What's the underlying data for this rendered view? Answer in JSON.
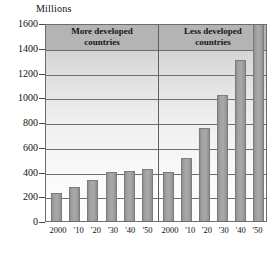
{
  "chart_data": {
    "type": "bar",
    "title": "",
    "units_label": "Millions",
    "xlabel": "",
    "ylabel": "Millions",
    "ylim": [
      0,
      1600
    ],
    "ytick_values": [
      1600,
      1400,
      1200,
      1000,
      800,
      600,
      400,
      200,
      0
    ],
    "ytick_labels": [
      "1600",
      "1400",
      "1200",
      "1000",
      "800",
      "600",
      "400",
      "200",
      "0"
    ],
    "grid": "horizontal",
    "legend_position": "none",
    "categories": [
      "2000",
      "'10",
      "'20",
      "'30",
      "'40",
      "'50"
    ],
    "groups": [
      {
        "name": "More developed countries",
        "label_line1": "More developed",
        "label_line2": "countries",
        "values": [
          230,
          275,
          335,
          395,
          405,
          420
        ]
      },
      {
        "name": "Less developed countries",
        "label_line1": "Less developed",
        "label_line2": "countries",
        "values": [
          400,
          510,
          750,
          1020,
          1305,
          1600
        ]
      }
    ],
    "colors": {
      "bar_fill": "#a2a2a2",
      "bar_edge": "#7c7c7c",
      "header_band": "#b4b4b4",
      "gridline": "#6f6f6f",
      "frame": "#6d6d6d",
      "text": "#111111"
    }
  }
}
